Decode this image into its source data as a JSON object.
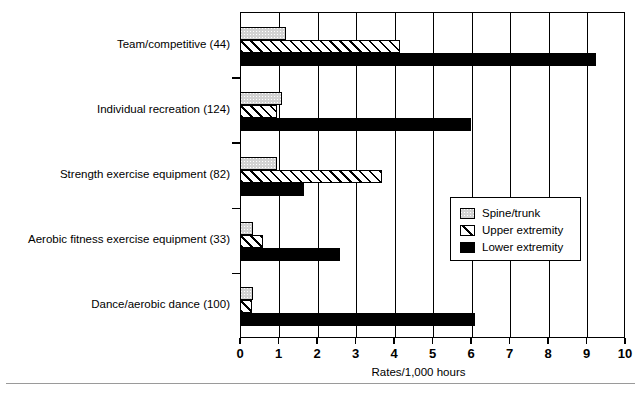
{
  "chart_data": {
    "type": "bar",
    "orientation": "horizontal",
    "title": "",
    "xlabel": "Rates/1,000 hours",
    "ylabel": "",
    "xlim": [
      0,
      10
    ],
    "xticks": [
      "0",
      "1",
      "2",
      "3",
      "4",
      "5",
      "6",
      "7",
      "8",
      "9",
      "10"
    ],
    "grid": true,
    "legend_position": "center-right",
    "categories": [
      "Team/competitive (44)",
      "Individual recreation (124)",
      "Strength exercise equipment (82)",
      "Aerobic fitness exercise equipment (33)",
      "Dance/aerobic dance (100)"
    ],
    "series": [
      {
        "name": "Spine/trunk",
        "values": [
          1.2,
          1.1,
          0.95,
          0.35,
          0.35
        ]
      },
      {
        "name": "Upper extremity",
        "values": [
          4.15,
          0.95,
          3.7,
          0.6,
          0.3
        ]
      },
      {
        "name": "Lower extremity",
        "values": [
          9.25,
          6.0,
          1.65,
          2.6,
          6.1
        ]
      }
    ]
  },
  "legend": {
    "items": [
      {
        "label": "Spine/trunk",
        "pattern": "gray-stipple"
      },
      {
        "label": "Upper extremity",
        "pattern": "diagonal-hatch"
      },
      {
        "label": "Lower extremity",
        "pattern": "solid-black"
      }
    ]
  },
  "axis": {
    "x_title": "Rates/1,000 hours"
  }
}
